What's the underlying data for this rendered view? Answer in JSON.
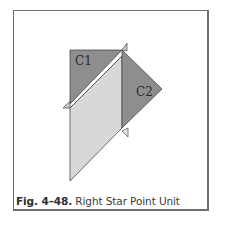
{
  "figure": {
    "caption_label": "Fig. 4–48.",
    "caption_text": " Right Star Point Unit",
    "pieces": [
      {
        "id": "C1",
        "label": "C1",
        "shape": "triangle",
        "color": "#8e8e8e"
      },
      {
        "id": "C2",
        "label": "C2",
        "shape": "triangle",
        "color": "#8e8e8e"
      },
      {
        "id": "center",
        "label": "",
        "shape": "parallelogram",
        "color": "#d8d8d8"
      }
    ],
    "colors": {
      "dark_piece": "#8e8e8e",
      "light_piece": "#d8d8d8",
      "outline": "#4a4a4a",
      "frame": "#6e6e6e"
    }
  }
}
